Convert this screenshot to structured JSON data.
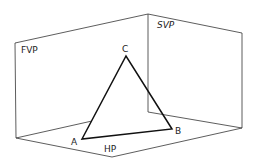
{
  "diagram": {
    "planes": {
      "fvp": "FVP",
      "svp": "SVP",
      "hp": "HP"
    },
    "vertices": {
      "a": "A",
      "b": "B",
      "c": "C"
    },
    "colors": {
      "line": "#222222",
      "background": "#ffffff"
    }
  }
}
